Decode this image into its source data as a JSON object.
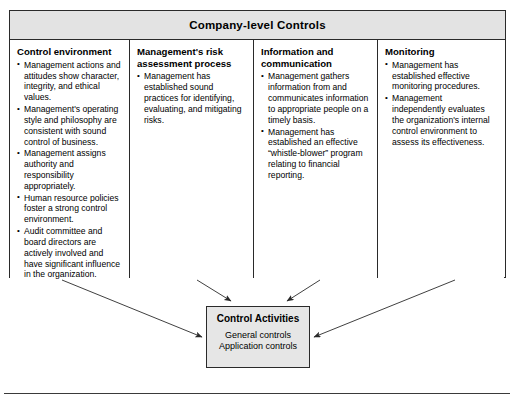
{
  "matrix": {
    "title": "Company-level Controls",
    "columns": [
      {
        "heading": "Control environment",
        "bullets": [
          "Management actions and attitudes show character, integrity, and ethical values.",
          "Management's operating style and philosophy are consistent with sound control of business.",
          "Management assigns authority and responsibility appropriately.",
          "Human resource policies foster a strong control environment.",
          "Audit committee and board directors are actively involved and have significant influence in the organization."
        ]
      },
      {
        "heading": "Management's risk assessment process",
        "bullets": [
          "Management has established sound practices for identifying, evaluating, and mitigating risks."
        ]
      },
      {
        "heading": "Information and communication",
        "bullets": [
          "Management gathers information from and communicates information to appropriate people on a timely basis.",
          "Management has established an effective “whistle-blower” program relating to financial reporting."
        ]
      },
      {
        "heading": "Monitoring",
        "bullets": [
          "Management has established effective monitoring procedures.",
          "Management independently evaluates the organization's internal control environment to assess its effectiveness."
        ]
      }
    ]
  },
  "control_activities": {
    "title": "Control Activities",
    "lines": [
      "General controls",
      "Application controls"
    ]
  },
  "footer": {
    "caption": ""
  },
  "colors": {
    "border": "#2a2a2a",
    "header_fill": "#e3e3e3",
    "box_fill": "#e6e6e6",
    "page": "#ffffff"
  }
}
